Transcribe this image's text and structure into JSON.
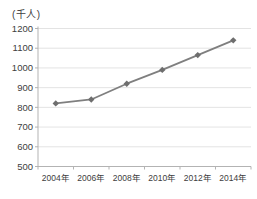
{
  "chart_data": {
    "type": "line",
    "title": "",
    "xlabel": "",
    "ylabel": "(千人)",
    "categories": [
      "2004年",
      "2006年",
      "2008年",
      "2010年",
      "2012年",
      "2014年"
    ],
    "values": [
      820,
      840,
      920,
      990,
      1065,
      1140
    ],
    "ylim": [
      500,
      1200
    ],
    "yticks": [
      500,
      600,
      700,
      800,
      900,
      1000,
      1100,
      1200
    ],
    "grid": true,
    "legend": false,
    "marker": "diamond",
    "colors": {
      "line": "#7f7f7f",
      "marker": "#6e6e6e",
      "grid": "#dcdcdc",
      "axis": "#b3b3b3",
      "text": "#404040",
      "background": "#ffffff"
    }
  }
}
